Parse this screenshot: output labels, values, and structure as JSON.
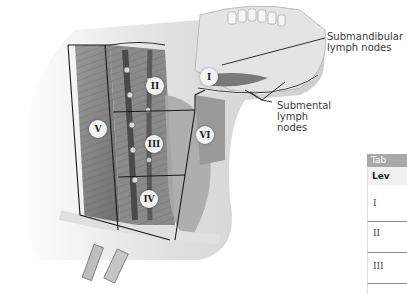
{
  "figure": {
    "callouts": {
      "submandibular": [
        "Submandibular",
        "lymph nodes"
      ],
      "submental": [
        "Submental",
        "lymph",
        "nodes"
      ]
    },
    "levels": [
      "I",
      "II",
      "III",
      "IV",
      "V",
      "VI"
    ]
  },
  "table": {
    "title": "Tab",
    "header": "Lev",
    "rows": [
      "I",
      "II",
      "III",
      "IV"
    ]
  },
  "colors": {
    "table_title_bg": "#a9a9a9",
    "table_header_bg": "#f1f1f1",
    "region_line": "#1a1a1a"
  }
}
